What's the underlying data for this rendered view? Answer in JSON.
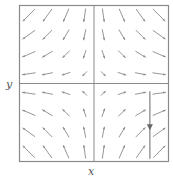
{
  "chart_data": {
    "type": "quiver",
    "title": "",
    "xlabel": "x",
    "ylabel": "y",
    "xlim": [
      -2,
      2
    ],
    "ylim": [
      -2,
      2
    ],
    "grid": false,
    "center_axes": true,
    "field": {
      "dx": "x",
      "dy": "-y",
      "description": "saddle point at origin"
    },
    "sample_x": [
      -1.75,
      -1.25,
      -0.75,
      -0.25,
      0.25,
      0.75,
      1.25,
      1.75
    ],
    "sample_y": [
      1.75,
      1.25,
      0.75,
      0.25,
      -0.25,
      -0.75,
      -1.25,
      -1.75
    ],
    "trajectory": {
      "x": [
        1.5,
        1.5
      ],
      "y": [
        -0.2,
        -1.93
      ],
      "arrow_direction": "down",
      "arrow_at_y": -1.15
    },
    "colors": {
      "frame": "#8a8a8a",
      "arrows": "#8a8a8a",
      "axes": "#8a8a8a",
      "trajectory": "#8a8a8a",
      "labels": "#555555"
    }
  }
}
